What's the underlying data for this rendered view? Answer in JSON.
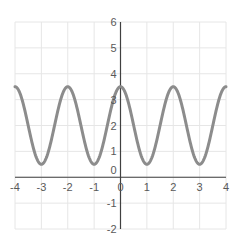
{
  "chart_data": {
    "type": "line",
    "title": "",
    "xlabel": "",
    "ylabel": "",
    "function": "y = 2 + 1.5*cos(pi*x)",
    "xlim": [
      -4,
      4
    ],
    "ylim": [
      -2,
      6
    ],
    "x_ticks": [
      "-4",
      "-3",
      "-2",
      "-1",
      "0",
      "1",
      "2",
      "3",
      "4"
    ],
    "y_ticks": [
      "-2",
      "-1",
      "0",
      "1",
      "2",
      "3",
      "4",
      "5",
      "6"
    ],
    "grid": true,
    "legend": "none",
    "series": [
      {
        "name": "curve",
        "color": "#8c8c8c",
        "x": [
          -4,
          -3.5,
          -3,
          -2.5,
          -2,
          -1.5,
          -1,
          -0.5,
          0,
          0.5,
          1,
          1.5,
          2,
          2.5,
          3,
          3.5,
          4
        ],
        "values": [
          3.5,
          2,
          0.5,
          2,
          3.5,
          2,
          0.5,
          2,
          3.5,
          2,
          0.5,
          2,
          3.5,
          2,
          0.5,
          2,
          3.5
        ]
      }
    ],
    "extrema": {
      "maxima": [
        [
          -4,
          3.5
        ],
        [
          -2,
          3.5
        ],
        [
          0,
          3.5
        ],
        [
          2,
          3.5
        ],
        [
          4,
          3.5
        ]
      ],
      "minima": [
        [
          -3,
          0.5
        ],
        [
          -1,
          0.5
        ],
        [
          1,
          0.5
        ],
        [
          3,
          0.5
        ]
      ]
    }
  },
  "colors": {
    "axis": "#404040",
    "grid": "#e6e6e6",
    "curve": "#8c8c8c",
    "background": "#ffffff"
  }
}
